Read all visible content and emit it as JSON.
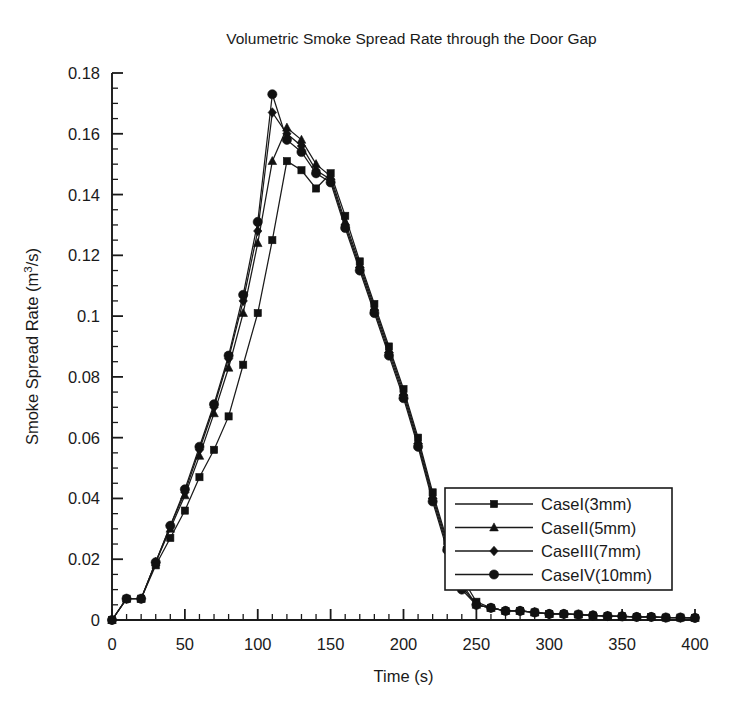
{
  "chart_data": {
    "type": "line",
    "title": "Volumetric Smoke Spread Rate through the Door Gap",
    "xlabel": "Time (s)",
    "ylabel": "Smoke Spread Rate (m3/s)",
    "ylabel_display": "Smoke Spread Rate (m³/s)",
    "xlim": [
      0,
      400
    ],
    "ylim": [
      0,
      0.18
    ],
    "xticks": [
      0,
      50,
      100,
      150,
      200,
      250,
      300,
      350,
      400
    ],
    "xtick_labels": [
      "0",
      "50",
      "100",
      "150",
      "200",
      "250",
      "300",
      "350",
      "400"
    ],
    "xtick_minor_step": 10,
    "yticks": [
      0,
      0.02,
      0.04,
      0.06,
      0.08,
      0.1,
      0.12,
      0.14,
      0.16,
      0.18
    ],
    "ytick_labels": [
      "0",
      "0.02",
      "0.04",
      "0.06",
      "0.08",
      "0.1",
      "0.12",
      "0.14",
      "0.16",
      "0.18"
    ],
    "ytick_minor_step": 0.005,
    "grid": false,
    "legend_position": "lower-right",
    "x": [
      0,
      10,
      20,
      30,
      40,
      50,
      60,
      70,
      80,
      90,
      100,
      110,
      120,
      130,
      140,
      150,
      160,
      170,
      180,
      190,
      200,
      210,
      220,
      230,
      240,
      250,
      260,
      270,
      280,
      290,
      300,
      310,
      320,
      330,
      340,
      350,
      360,
      370,
      380,
      390,
      400
    ],
    "series": [
      {
        "name": "CaseI(3mm)",
        "marker": "square",
        "color": "#111111",
        "values": [
          0,
          0.007,
          0.007,
          0.018,
          0.027,
          0.036,
          0.047,
          0.056,
          0.067,
          0.084,
          0.101,
          0.125,
          0.151,
          0.148,
          0.142,
          0.147,
          0.133,
          0.118,
          0.104,
          0.09,
          0.076,
          0.06,
          0.042,
          0.026,
          0.014,
          0.006,
          0.004,
          0.003,
          0.003,
          0.0025,
          0.002,
          0.002,
          0.0018,
          0.0015,
          0.0013,
          0.0012,
          0.001,
          0.001,
          0.0008,
          0.0008,
          0.0007
        ]
      },
      {
        "name": "CaseII(5mm)",
        "marker": "triangle",
        "color": "#111111",
        "values": [
          0,
          0.007,
          0.007,
          0.019,
          0.03,
          0.041,
          0.054,
          0.068,
          0.083,
          0.101,
          0.124,
          0.151,
          0.162,
          0.158,
          0.15,
          0.146,
          0.131,
          0.117,
          0.103,
          0.089,
          0.075,
          0.059,
          0.041,
          0.025,
          0.012,
          0.005,
          0.004,
          0.003,
          0.003,
          0.0025,
          0.002,
          0.002,
          0.0018,
          0.0015,
          0.0013,
          0.0012,
          0.001,
          0.001,
          0.0008,
          0.0008,
          0.0007
        ]
      },
      {
        "name": "CaseIII(7mm)",
        "marker": "diamond",
        "color": "#111111",
        "values": [
          0,
          0.007,
          0.007,
          0.019,
          0.031,
          0.042,
          0.056,
          0.07,
          0.086,
          0.105,
          0.128,
          0.167,
          0.16,
          0.156,
          0.148,
          0.145,
          0.13,
          0.116,
          0.102,
          0.088,
          0.074,
          0.058,
          0.04,
          0.024,
          0.011,
          0.005,
          0.004,
          0.003,
          0.003,
          0.0025,
          0.002,
          0.002,
          0.0018,
          0.0015,
          0.0013,
          0.0012,
          0.001,
          0.001,
          0.0008,
          0.0008,
          0.0007
        ]
      },
      {
        "name": "CaseIV(10mm)",
        "marker": "circle",
        "color": "#111111",
        "values": [
          0,
          0.007,
          0.007,
          0.019,
          0.031,
          0.043,
          0.057,
          0.071,
          0.087,
          0.107,
          0.131,
          0.173,
          0.158,
          0.154,
          0.147,
          0.144,
          0.129,
          0.115,
          0.101,
          0.087,
          0.073,
          0.057,
          0.039,
          0.023,
          0.01,
          0.005,
          0.004,
          0.003,
          0.003,
          0.0025,
          0.002,
          0.002,
          0.0018,
          0.0015,
          0.0013,
          0.0012,
          0.001,
          0.001,
          0.0008,
          0.0008,
          0.0007
        ]
      }
    ]
  },
  "legend": {
    "entries": [
      "CaseI(3mm)",
      "CaseII(5mm)",
      "CaseIII(7mm)",
      "CaseIV(10mm)"
    ]
  }
}
